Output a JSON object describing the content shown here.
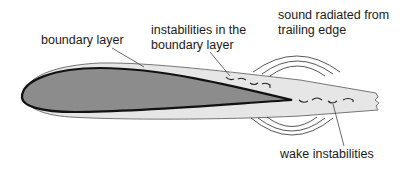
{
  "diagram": {
    "labels": {
      "boundary_layer": "boundary layer",
      "instabilities_line1": "instabilities in the",
      "instabilities_line2": "boundary layer",
      "sound_line1": "sound radiated from",
      "sound_line2": "trailing edge",
      "wake": "wake instabilities"
    },
    "colors": {
      "airfoil_fill": "#8c8c8c",
      "airfoil_outline": "#111111",
      "boundary_layer_fill": "#e6e6e6",
      "line": "#333333",
      "background": "#ffffff"
    }
  }
}
